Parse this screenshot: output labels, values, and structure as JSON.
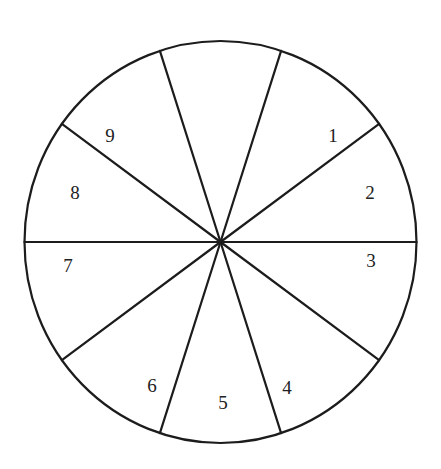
{
  "diagram": {
    "type": "spinner-wheel",
    "sector_count": 10,
    "sector_angle_degrees": 36,
    "sectors": [
      {
        "label": ""
      },
      {
        "label": "1"
      },
      {
        "label": "2"
      },
      {
        "label": "3"
      },
      {
        "label": "4"
      },
      {
        "label": "5"
      },
      {
        "label": "6"
      },
      {
        "label": "7"
      },
      {
        "label": "8"
      },
      {
        "label": "9"
      }
    ],
    "colors": {
      "stroke": "#1c1c1c",
      "fill": "#ffffff",
      "text": "#222222"
    }
  }
}
